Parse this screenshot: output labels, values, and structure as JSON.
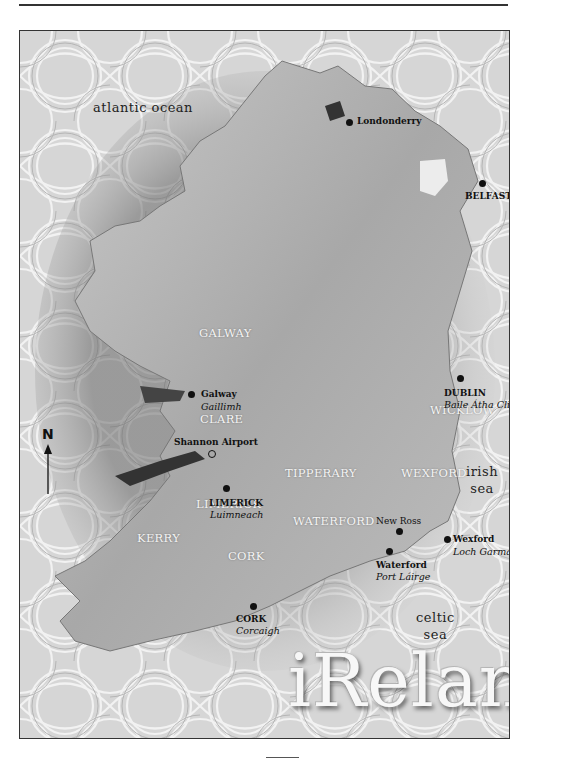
{
  "map": {
    "title": "iReland",
    "seas": [
      {
        "id": "atlantic",
        "text": "atlantic ocean",
        "x": 10,
        "y": 97
      },
      {
        "id": "irish",
        "line1": "irish",
        "line2": "sea",
        "x": 444,
        "y": 468
      },
      {
        "id": "celtic",
        "line1": "celtic",
        "line2": "sea",
        "x": 396,
        "y": 612
      }
    ],
    "cities": [
      {
        "id": "londonderry",
        "name": "Londonderry",
        "irish": "",
        "dot_x": 328,
        "dot_y": 90,
        "label_x": 338,
        "label_y": 86
      },
      {
        "id": "belfast",
        "name": "BELFAST",
        "irish": "",
        "dot_x": 460,
        "dot_y": 151,
        "label_x": 443,
        "label_y": 160
      },
      {
        "id": "galway",
        "name": "Galway",
        "irish": "Gaillimh",
        "dot_x": 169,
        "dot_y": 363,
        "label_x": 180,
        "label_y": 358
      },
      {
        "id": "dublin",
        "name": "DUBLIN",
        "irish": "Baile Átha Cliath",
        "dot_x": 437,
        "dot_y": 346,
        "label_x": 423,
        "label_y": 357
      },
      {
        "id": "shannon",
        "name": "Shannon Airport",
        "irish": "",
        "ring": true,
        "dot_x": 188,
        "dot_y": 420,
        "label_x": 152,
        "label_y": 408
      },
      {
        "id": "limerick",
        "name": "LIMERICK",
        "irish": "Luimneach",
        "dot_x": 202,
        "dot_y": 456,
        "label_x": 186,
        "label_y": 467
      },
      {
        "id": "newross",
        "name": "New Ross",
        "irish": "",
        "dot_x": 374,
        "dot_y": 496,
        "label_x": 354,
        "label_y": 487
      },
      {
        "id": "waterford",
        "name": "Waterford",
        "irish": "Port Láirge",
        "dot_x": 364,
        "dot_y": 520,
        "label_x": 354,
        "label_y": 530
      },
      {
        "id": "wexford",
        "name": "Wexford",
        "irish": "Loch Garman",
        "dot_x": 422,
        "dot_y": 505,
        "label_x": 432,
        "label_y": 502
      },
      {
        "id": "cork",
        "name": "CORK",
        "irish": "Corcaigh",
        "dot_x": 230,
        "dot_y": 574,
        "label_x": 213,
        "label_y": 584
      }
    ],
    "counties": [
      {
        "id": "galway",
        "name": "GALWAY",
        "x": 183,
        "y": 329
      },
      {
        "id": "clare",
        "name": "CLARE",
        "x": 185,
        "y": 415
      },
      {
        "id": "wicklow",
        "name": "WICKLOW",
        "x": 406,
        "y": 405
      },
      {
        "id": "tipperary",
        "name": "TIPPERARY",
        "x": 265,
        "y": 468
      },
      {
        "id": "wexford",
        "name": "WEXFORD",
        "x": 380,
        "y": 470
      },
      {
        "id": "limerick",
        "name": "LIMERICK",
        "x": 174,
        "y": 495
      },
      {
        "id": "waterford",
        "name": "WATERFORD",
        "x": 273,
        "y": 518
      },
      {
        "id": "kerry",
        "name": "KERRY",
        "x": 115,
        "y": 535
      },
      {
        "id": "cork",
        "name": "CORK",
        "x": 210,
        "y": 553
      }
    ],
    "north_arrow": {
      "label": "N",
      "x": 40,
      "y": 398
    }
  }
}
